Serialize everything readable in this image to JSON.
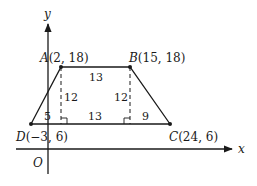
{
  "diagram": {
    "type": "coordinate-geometry-trapezoid",
    "axes": {
      "x_label": "x",
      "y_label": "y",
      "origin_label": "O"
    },
    "points": {
      "A": {
        "name": "A",
        "coords": "(2, 18)"
      },
      "B": {
        "name": "B",
        "coords": "(15, 18)"
      },
      "C": {
        "name": "C",
        "coords": "(24, 6)"
      },
      "D": {
        "name": "D",
        "coords": "(−3, 6)"
      }
    },
    "measurements": {
      "top_AB": "13",
      "height_left": "12",
      "height_right": "12",
      "bottom_left_segment": "5",
      "bottom_middle_segment": "13",
      "bottom_right_segment": "9"
    },
    "colors": {
      "stroke": "#1a1a1a",
      "background": "#ffffff"
    }
  }
}
